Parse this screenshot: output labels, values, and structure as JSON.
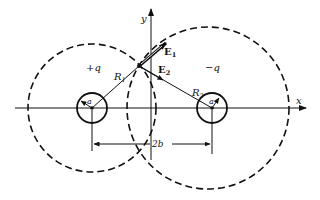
{
  "figure": {
    "type": "electrostatics-diagram"
  },
  "axes": {
    "x_label": "x",
    "y_label": "y"
  },
  "charges": [
    {
      "label": "+q",
      "radius_label": "a",
      "distance_label": "R",
      "distance_sub": "1"
    },
    {
      "label": "−q",
      "radius_label": "a",
      "distance_label": "R",
      "distance_sub": "2"
    }
  ],
  "fields": [
    {
      "label": "E",
      "sub": "1"
    },
    {
      "label": "E",
      "sub": "2"
    }
  ],
  "dimension": {
    "label": "2b"
  },
  "colors": {
    "ink": "#111111",
    "background": "#ffffff"
  }
}
